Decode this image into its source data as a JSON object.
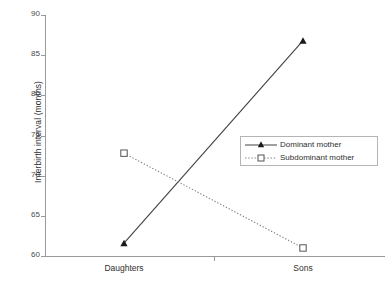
{
  "chart_data": {
    "type": "line",
    "title": "",
    "subtitle": "",
    "xlabel": "",
    "ylabel": "Interbirth interval (months)",
    "categories": [
      "Daughters",
      "Sons"
    ],
    "series": [
      {
        "name": "Dominant mother",
        "values": [
          61.6,
          86.8
        ],
        "line_style": "solid",
        "marker": "filled-triangle",
        "color": "#404040"
      },
      {
        "name": "Subdominant mother",
        "values": [
          72.8,
          61.0
        ],
        "line_style": "dotted",
        "marker": "open-square",
        "color": "#808080"
      }
    ],
    "ylim": [
      60,
      90
    ],
    "y_ticks": [
      60,
      65,
      70,
      75,
      80,
      85,
      90
    ],
    "y_tick_labels": [
      "60",
      "65",
      "70",
      "75",
      "80",
      "85",
      "90"
    ],
    "x_tick_labels": [
      "Daughters",
      "Sons"
    ],
    "grid": false,
    "legend_position": "center-right",
    "axis_color": "#9a9a9a"
  },
  "legend": {
    "entries": [
      {
        "label": "Dominant mother"
      },
      {
        "label": "Subdominant mother"
      }
    ]
  },
  "axes": {
    "y_title": "Interbirth interval (months)"
  }
}
